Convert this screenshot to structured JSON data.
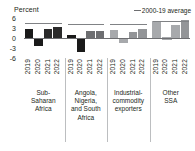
{
  "chart_data": {
    "type": "bar",
    "title": "Percent",
    "ylabel": "Percent",
    "xlabel": "",
    "ylim": [
      -6,
      6
    ],
    "yticks": [
      6,
      3,
      0,
      -3,
      -6
    ],
    "ytick_labels": [
      "6",
      "3",
      "0",
      "-3",
      "-6"
    ],
    "grid": false,
    "legend": {
      "position": "top-right",
      "entries": [
        {
          "label": "2000-19 average",
          "marker": "line",
          "color": "#808285"
        }
      ]
    },
    "categories": [
      "Sub-Saharan Africa",
      "Angola, Nigeria, and South Africa",
      "Industrial-commodity exporters",
      "Other SSA"
    ],
    "x": [
      "2019",
      "2020",
      "2021",
      "2022"
    ],
    "groups": [
      {
        "name": "Sub-Saharan Africa",
        "label_lines": [
          "Sub-",
          "Saharan",
          "Africa"
        ],
        "average": 4.4,
        "bars": [
          {
            "year": "2019",
            "value": 2.6,
            "color": "#1a1a1a"
          },
          {
            "year": "2020",
            "value": -2.3,
            "color": "#1a1a1a"
          },
          {
            "year": "2021",
            "value": 2.8,
            "color": "#2b2b2b"
          },
          {
            "year": "2022",
            "value": 3.3,
            "color": "#2b2b2b"
          }
        ]
      },
      {
        "name": "Angola, Nigeria, and South Africa",
        "label_lines": [
          "Angola,",
          "Nigeria,",
          "and South",
          "Africa"
        ],
        "average": 4.1,
        "bars": [
          {
            "year": "2019",
            "value": 1.0,
            "color": "#1a1a1a"
          },
          {
            "year": "2020",
            "value": -4.1,
            "color": "#1a1a1a"
          },
          {
            "year": "2021",
            "value": 2.2,
            "color": "#6d6e71"
          },
          {
            "year": "2022",
            "value": 2.2,
            "color": "#6d6e71"
          }
        ]
      },
      {
        "name": "Industrial-commodity exporters",
        "label_lines": [
          "Industrial-",
          "commodity",
          "exporters"
        ],
        "average": 4.3,
        "bars": [
          {
            "year": "2019",
            "value": 2.3,
            "color": "#a7a9ac"
          },
          {
            "year": "2020",
            "value": -1.6,
            "color": "#a7a9ac"
          },
          {
            "year": "2021",
            "value": 1.9,
            "color": "#939598"
          },
          {
            "year": "2022",
            "value": 2.8,
            "color": "#939598"
          }
        ]
      },
      {
        "name": "Other SSA",
        "label_lines": [
          "Other",
          "SSA"
        ],
        "average": 5.2,
        "bars": [
          {
            "year": "2019",
            "value": 5.2,
            "color": "#a7a9ac"
          },
          {
            "year": "2020",
            "value": 0.3,
            "color": "#ffffff"
          },
          {
            "year": "2021",
            "value": 4.0,
            "color": "#a7a9ac"
          },
          {
            "year": "2022",
            "value": 5.4,
            "color": "#939598"
          }
        ]
      }
    ]
  }
}
